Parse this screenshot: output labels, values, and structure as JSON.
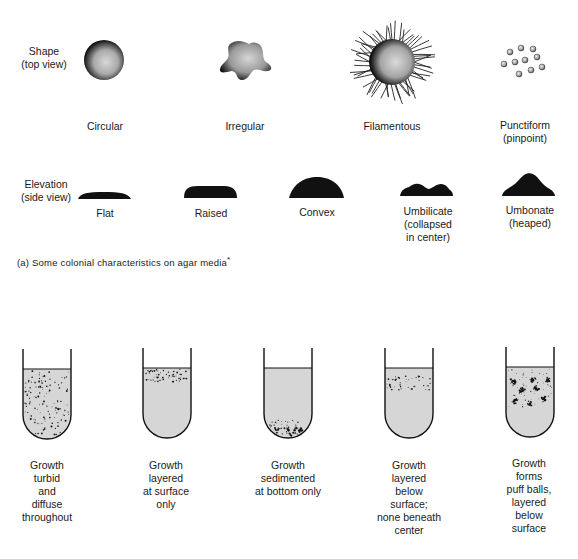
{
  "shape_row": {
    "label_line1": "Shape",
    "label_line2": "(top view)",
    "items": [
      {
        "name": "Circular",
        "line2": ""
      },
      {
        "name": "Irregular",
        "line2": ""
      },
      {
        "name": "Filamentous",
        "line2": ""
      },
      {
        "name": "Punctiform",
        "line2": "(pinpoint)"
      }
    ]
  },
  "elevation_row": {
    "label_line1": "Elevation",
    "label_line2": "(side view)",
    "items": [
      {
        "name": "Flat",
        "line2": "",
        "line3": ""
      },
      {
        "name": "Raised",
        "line2": "",
        "line3": ""
      },
      {
        "name": "Convex",
        "line2": "",
        "line3": ""
      },
      {
        "name": "Umbilicate",
        "line2": "(collapsed",
        "line3": "in center)"
      },
      {
        "name": "Umbonate",
        "line2": "(heaped)",
        "line3": ""
      }
    ]
  },
  "caption_a": "(a) Some colonial characteristics on agar media",
  "caption_mark": "*",
  "broth_tubes": [
    {
      "lines": [
        "Growth",
        "turbid",
        "and",
        "diffuse",
        "throughout"
      ]
    },
    {
      "lines": [
        "Growth",
        "layered",
        "at surface",
        "only"
      ]
    },
    {
      "lines": [
        "Growth",
        "sedimented",
        "at bottom only"
      ]
    },
    {
      "lines": [
        "Growth",
        "layered",
        "below",
        "surface;",
        "none beneath",
        "center"
      ]
    },
    {
      "lines": [
        "Growth",
        "forms",
        "puff balls,",
        "layered",
        "below",
        "surface"
      ]
    }
  ],
  "colors": {
    "ink": "#111111",
    "medium": "#d6d6d6",
    "background": "#ffffff"
  }
}
